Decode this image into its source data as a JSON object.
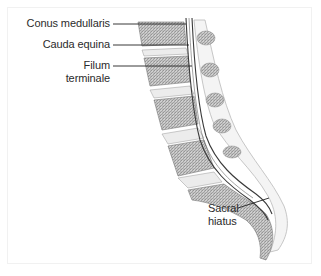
{
  "figure": {
    "type": "anatomical illustration",
    "view": "sagittal section of lumbosacral spine",
    "labels": [
      {
        "id": "conus",
        "text": "Conus medullaris"
      },
      {
        "id": "cauda",
        "text": "Cauda equina"
      },
      {
        "id": "filum_1",
        "text": "Filum"
      },
      {
        "id": "filum_2",
        "text": "terminale"
      },
      {
        "id": "sacral_1",
        "text": "Sacral"
      },
      {
        "id": "sacral_2",
        "text": "hiatus"
      }
    ],
    "colors": {
      "background": "#ffffff",
      "label_text": "#2b2b2b",
      "leader_line": "#222222",
      "bone_shade": "#9a9a9a",
      "disc_fill": "#e6e6e6",
      "dural_sac": "#3a3a3a"
    }
  }
}
